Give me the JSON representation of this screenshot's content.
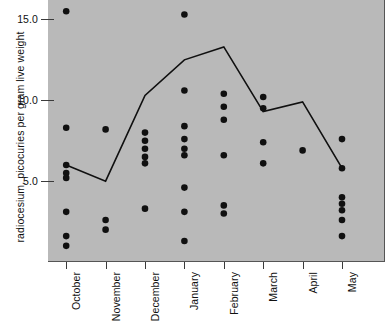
{
  "chart_data": {
    "type": "scatter",
    "title": "",
    "xlabel": "",
    "ylabel": "radiocesium, picocuries per gram live weight",
    "categories": [
      "October",
      "November",
      "December",
      "January",
      "February",
      "March",
      "April",
      "May"
    ],
    "ylim": [
      0.0,
      16.2
    ],
    "xlim": [
      0,
      8
    ],
    "yticks": [
      5.0,
      10.0,
      15.0
    ],
    "ytick_labels": [
      "5.0",
      "10.0",
      "15.0"
    ],
    "grid": false,
    "legend": null,
    "background_color": "#b9b9b9",
    "marker_color": "#101010",
    "line_color": "#101010",
    "series": [
      {
        "name": "individual measurements",
        "type": "scatter",
        "points": [
          {
            "category": "October",
            "values": [
              15.5,
              8.3,
              6.0,
              5.5,
              5.2,
              3.1,
              1.6,
              1.0
            ]
          },
          {
            "category": "November",
            "values": [
              8.2,
              2.6,
              2.0
            ]
          },
          {
            "category": "December",
            "values": [
              8.0,
              7.5,
              7.0,
              6.5,
              6.1,
              3.3
            ]
          },
          {
            "category": "January",
            "values": [
              15.3,
              10.6,
              8.4,
              7.6,
              7.0,
              6.6,
              4.6,
              3.1,
              1.3
            ]
          },
          {
            "category": "February",
            "values": [
              10.4,
              9.6,
              8.8,
              6.6,
              3.5,
              3.0
            ]
          },
          {
            "category": "March",
            "values": [
              10.2,
              9.5,
              7.4,
              6.1
            ]
          },
          {
            "category": "April",
            "values": [
              6.9
            ]
          },
          {
            "category": "May",
            "values": [
              7.6,
              5.8,
              4.0,
              3.6,
              3.2,
              2.6,
              1.6
            ]
          }
        ]
      },
      {
        "name": "monthly mean trend line",
        "type": "line",
        "values": [
          6.0,
          5.0,
          10.3,
          12.5,
          13.3,
          9.3,
          9.9,
          5.8
        ]
      }
    ]
  }
}
